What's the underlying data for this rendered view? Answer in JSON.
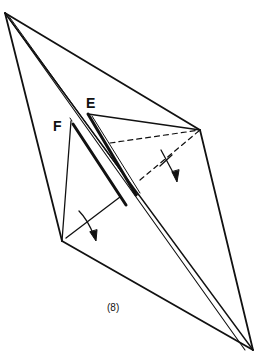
{
  "diagram": {
    "type": "origami-fold-step",
    "step_label": "(8)",
    "labels": {
      "flap_e": "E",
      "flap_f": "F"
    },
    "colors": {
      "line": "#111111",
      "background": "#ffffff"
    },
    "vertices": {
      "top_left": [
        5,
        13
      ],
      "right": [
        200,
        130
      ],
      "bottom_right": [
        253,
        350
      ],
      "left_bottom": [
        62,
        241
      ],
      "flap_e_tip": [
        88,
        114
      ],
      "flap_f_tip": [
        71,
        121
      ]
    },
    "annotations": [
      {
        "kind": "valley-fold-dashed",
        "note": "dashed fold lines from E flap region to right vertex"
      },
      {
        "kind": "fold-arrow",
        "note": "curved arrow near right flap pointing down"
      },
      {
        "kind": "fold-arrow",
        "note": "curved arrow near left-bottom flap pointing down-right"
      }
    ]
  }
}
